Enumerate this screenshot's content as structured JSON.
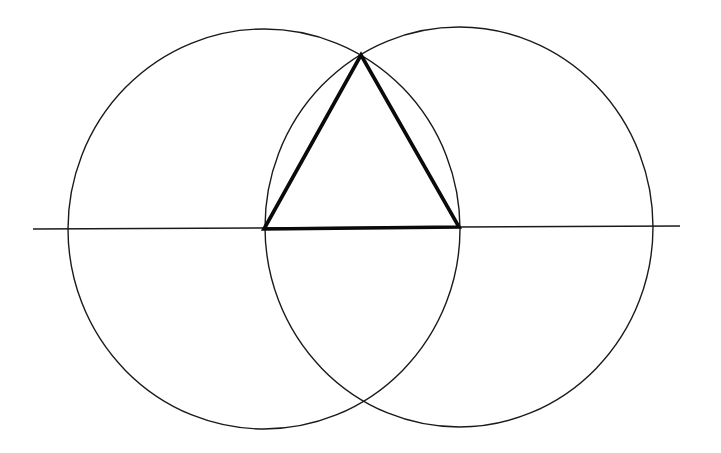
{
  "diagram": {
    "title": "",
    "colors": {
      "background": "#ffffff",
      "stroke": "#1a1a1a",
      "triangle": "#0a0a0a"
    },
    "baseline": {
      "x1": 33,
      "y1": 229,
      "x2": 680,
      "y2": 226
    },
    "circles": [
      {
        "name": "left-circle",
        "cx": 264,
        "cy": 229,
        "rx": 196,
        "ry": 200
      },
      {
        "name": "right-circle",
        "cx": 459,
        "cy": 227,
        "rx": 194,
        "ry": 200
      }
    ],
    "triangle": {
      "points": [
        [
          264,
          229
        ],
        [
          361,
          55
        ],
        [
          459,
          227
        ]
      ]
    },
    "labels": []
  }
}
